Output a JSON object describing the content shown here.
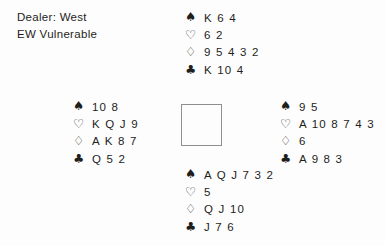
{
  "header": {
    "dealer": "Dealer: West",
    "vulnerability": "EW Vulnerable"
  },
  "suit_symbols": {
    "spades": "♠",
    "hearts": "♡",
    "diamonds": "♢",
    "clubs": "♣"
  },
  "hands": {
    "north": {
      "spades": "K 6 4",
      "hearts": "6 2",
      "diamonds": "9 5 4 3 2",
      "clubs": "K 10 4"
    },
    "west": {
      "spades": "10 8",
      "hearts": "K Q J 9",
      "diamonds": "A K 8 7",
      "clubs": "Q 5 2"
    },
    "east": {
      "spades": "9 5",
      "hearts": "A 10 8 7 4 3",
      "diamonds": "6",
      "clubs": "A 9 8 3"
    },
    "south": {
      "spades": "A Q J 7 3 2",
      "hearts": "5",
      "diamonds": "Q J 10",
      "clubs": "J 7 6"
    }
  },
  "colors": {
    "ink": "#1e1e1c",
    "background": "#fdfdfd",
    "box_border": "#8f8f8f"
  }
}
